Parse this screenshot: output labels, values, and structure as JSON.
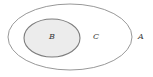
{
  "diagram": {
    "type": "set-venn-diagram",
    "background_color": "#ffffff",
    "canvas": {
      "width": 153,
      "height": 77
    },
    "outer_region": {
      "name": "A",
      "label": "A",
      "shape": "ellipse",
      "cx": 70,
      "cy": 37,
      "rx": 62,
      "ry": 33,
      "fill": "none",
      "stroke": "#8c8c8c",
      "stroke_width": 0.9
    },
    "inner_region": {
      "name": "B",
      "label": "B",
      "shape": "ellipse",
      "cx": 52,
      "cy": 38,
      "rx": 28,
      "ry": 19,
      "fill": "#ececec",
      "stroke": "#7d7d7d",
      "stroke_width": 1.1
    },
    "annulus_region": {
      "name": "C",
      "label": "C"
    },
    "labels": [
      {
        "id": "label-b",
        "text": "B",
        "x": 52,
        "y": 37,
        "color": "#3a3a3a",
        "style": "italic"
      },
      {
        "id": "label-c",
        "text": "C",
        "x": 96,
        "y": 37,
        "color": "#3a3a3a",
        "style": "italic"
      },
      {
        "id": "label-a",
        "text": "A",
        "x": 141,
        "y": 37,
        "color": "#3a3a3a",
        "style": "italic"
      }
    ]
  }
}
